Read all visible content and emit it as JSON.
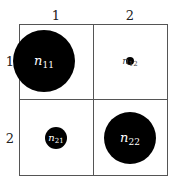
{
  "diagram": {
    "type": "contingency-table-balloon-plot",
    "col_labels": [
      "1",
      "2"
    ],
    "row_labels": [
      "1",
      "2"
    ],
    "cells": [
      {
        "row": 1,
        "col": 1,
        "label": "n",
        "sub": "11",
        "radius": 31,
        "cx": 44,
        "cy": 61
      },
      {
        "row": 1,
        "col": 2,
        "label": "n",
        "sub": "12",
        "radius": 4,
        "cx": 130,
        "cy": 61
      },
      {
        "row": 2,
        "col": 1,
        "label": "n",
        "sub": "21",
        "radius": 11,
        "cx": 56,
        "cy": 138
      },
      {
        "row": 2,
        "col": 2,
        "label": "n",
        "sub": "22",
        "radius": 26,
        "cx": 130,
        "cy": 138
      }
    ],
    "colors": {
      "circle": "#000000",
      "grid": "#555555",
      "text": "#222222"
    }
  }
}
